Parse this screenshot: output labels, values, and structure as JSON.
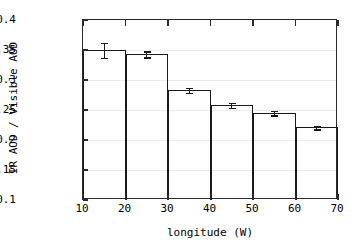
{
  "chart_data": {
    "type": "bar",
    "title": "",
    "xlabel": "longitude (W)",
    "ylabel": "IR AOD / Visible AOD",
    "xlim": [
      10,
      70
    ],
    "ylim": [
      0.1,
      0.4
    ],
    "grid": true,
    "legend": null,
    "xticks": [
      10,
      20,
      30,
      40,
      50,
      60,
      70
    ],
    "xtick_labels": [
      "10",
      "20",
      "30",
      "40",
      "50",
      "60",
      "70"
    ],
    "yticks": [
      0.1,
      0.15,
      0.2,
      0.25,
      0.3,
      0.35,
      0.4
    ],
    "ytick_labels": [
      "0.1",
      "0.15",
      "0.2",
      "0.25",
      "0.3",
      "0.35",
      "0.4"
    ],
    "bin_edges": [
      10,
      20,
      30,
      40,
      50,
      60,
      70
    ],
    "categories": [
      "10-20",
      "20-30",
      "30-40",
      "40-50",
      "50-60",
      "60-70"
    ],
    "x_centers": [
      15,
      25,
      35,
      45,
      55,
      65
    ],
    "values": [
      0.35,
      0.343,
      0.283,
      0.258,
      0.245,
      0.221
    ],
    "errors": [
      0.0125,
      0.005,
      0.004,
      0.004,
      0.004,
      0.003
    ],
    "colors": {
      "bar_edge": "#1a1a1a",
      "axis": "#2b2b2b",
      "grid": "#ececec",
      "background": "#ffffff",
      "text": "#000000"
    }
  }
}
